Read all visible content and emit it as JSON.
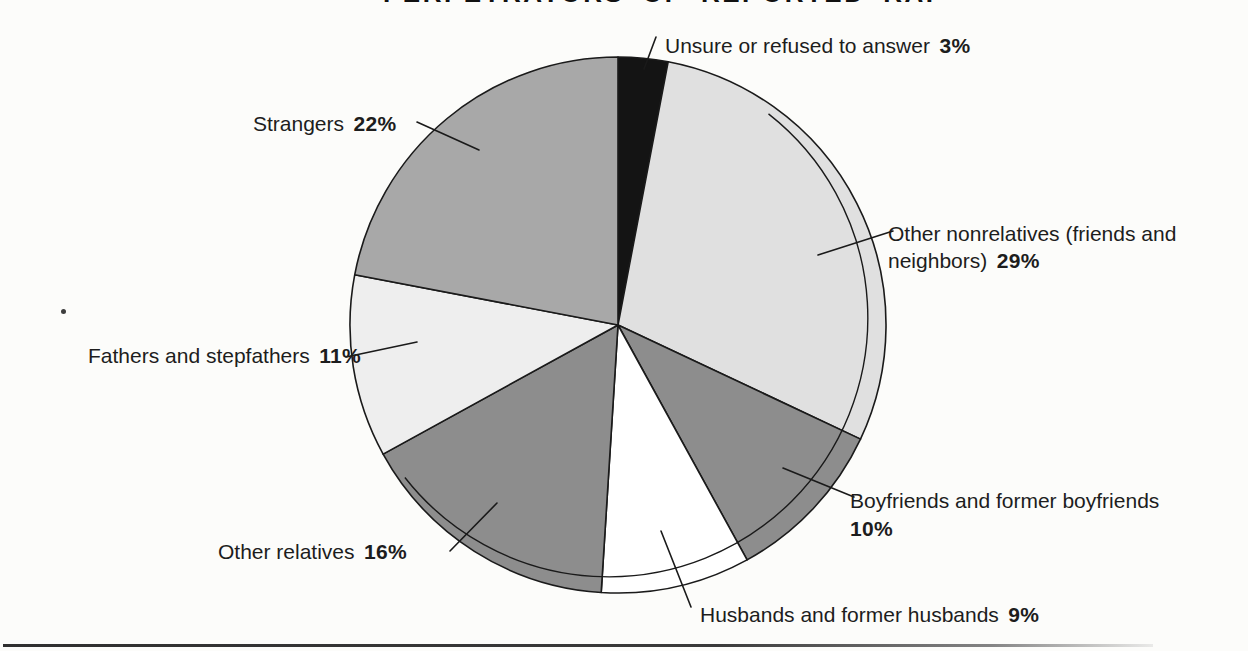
{
  "title": "PERPETRATORS OF REPORTED RAPES",
  "chart_data": {
    "type": "pie",
    "title": "PERPETRATORS OF REPORTED RAPES",
    "direction": "clockwise",
    "start_angle_deg_from_north": 0,
    "outline_color": "#1a1a1a",
    "slices": [
      {
        "label": "Unsure or refused to answer",
        "value": 3,
        "color": "#141414"
      },
      {
        "label": "Other nonrelatives (friends and neighbors)",
        "value": 29,
        "color": "#e0e0e0"
      },
      {
        "label": "Boyfriends and former boyfriends",
        "value": 10,
        "color": "#8d8d8d"
      },
      {
        "label": "Husbands and former husbands",
        "value": 9,
        "color": "#ffffff"
      },
      {
        "label": "Other relatives",
        "value": 16,
        "color": "#8d8d8d"
      },
      {
        "label": "Fathers and stepfathers",
        "value": 11,
        "color": "#eeeeee"
      },
      {
        "label": "Strangers",
        "value": 22,
        "color": "#a8a8a8"
      }
    ]
  },
  "callouts": {
    "unsure": {
      "text": "Unsure or refused to answer",
      "pct": "3%"
    },
    "strangers": {
      "text": "Strangers",
      "pct": "22%"
    },
    "nonrelatives": {
      "line1": "Other nonrelatives (friends and",
      "line2": "neighbors)",
      "pct": "29%"
    },
    "boyfriends": {
      "line1": "Boyfriends and former boyfriends",
      "pct": "10%"
    },
    "husbands": {
      "text": "Husbands and former husbands",
      "pct": "9%"
    },
    "other_relatives": {
      "text": "Other relatives",
      "pct": "16%"
    },
    "fathers": {
      "text": "Fathers and stepfathers",
      "pct": "11%"
    }
  }
}
